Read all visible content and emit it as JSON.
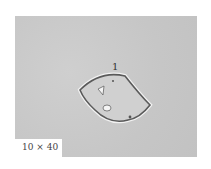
{
  "figure": {
    "annotation_label": "1",
    "magnification": "10 × 40",
    "colors": {
      "background": "#c9c9c9",
      "cell_outline": "#5a5a5a",
      "halo": "#f2f2f2"
    }
  }
}
